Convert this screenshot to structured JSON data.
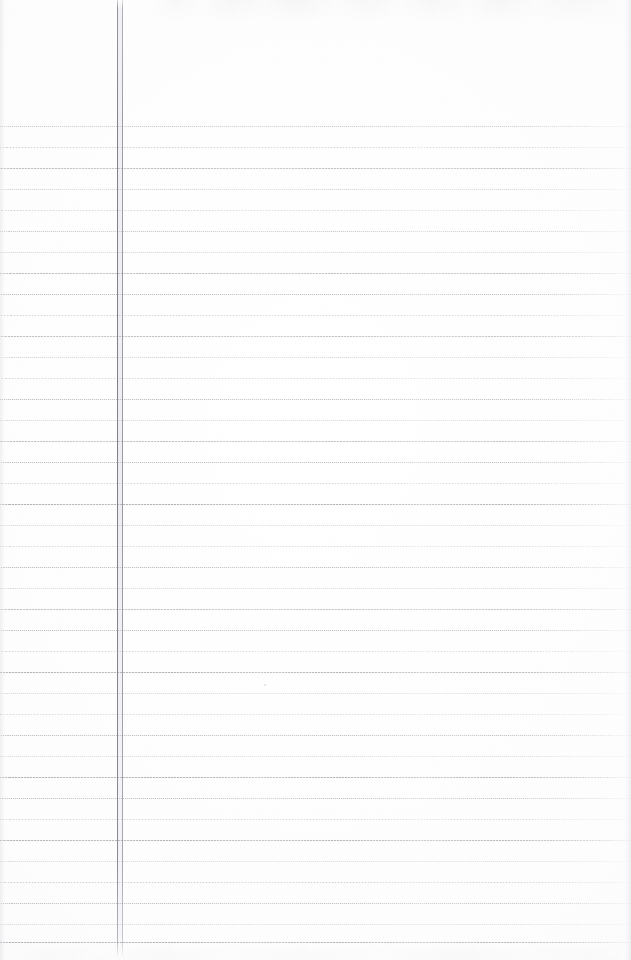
{
  "document": {
    "kind": "scanned-ruled-notebook-page",
    "title": "Blank ruled notebook page",
    "page_width": 631,
    "page_height": 960,
    "content_text": "",
    "has_handwriting": false,
    "paper_color": "#fdfdfe",
    "background_color": "#ffffff"
  },
  "ruling": {
    "label": "Horizontal ruled lines",
    "style": "dotted",
    "line_color": "#7a7c84",
    "line_count": 40,
    "first_line_y": 126,
    "line_spacing": 20.95,
    "line_thickness": 1,
    "line_start_x": 0,
    "line_end_x": 631,
    "line_y_positions": [
      126,
      147,
      168,
      189,
      210,
      231,
      252,
      273,
      294,
      315,
      336,
      357,
      378,
      399,
      420,
      441,
      462,
      483,
      504,
      525,
      546,
      567,
      588,
      609,
      630,
      651,
      672,
      693,
      714,
      735,
      756,
      777,
      798,
      819,
      840,
      861,
      882,
      903,
      924,
      942
    ]
  },
  "margin_rule": {
    "label": "Vertical margin rule",
    "style": "double-line",
    "color": "#74767f",
    "outer_x": 117,
    "inner_x": 122,
    "top_y": 0,
    "bottom_y": 956,
    "thickness": 1
  },
  "scan_artifacts": {
    "top_ghost_label": "Top edge bleed-through smudge",
    "bottom_ghost_label": "Bottom edge bleed-through smudge",
    "noise_label": "Paper grain speckle",
    "speck_label": "Stray ink speck",
    "speck_x": 264,
    "speck_y": 684
  }
}
